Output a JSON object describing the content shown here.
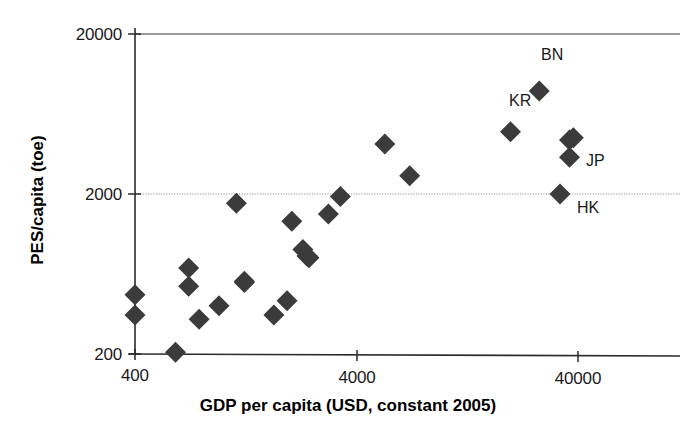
{
  "chart_data": {
    "type": "scatter",
    "title": "",
    "xlabel": "GDP per capita (USD, constant 2005)",
    "ylabel": "PES/capita (toe)",
    "xscale": "log",
    "yscale": "log",
    "xlim": [
      400,
      63000
    ],
    "ylim": [
      200,
      20000
    ],
    "xticks": [
      400,
      4000,
      40000
    ],
    "xticklabels": [
      "400",
      "4000",
      "40000"
    ],
    "yticks": [
      200,
      2000,
      20000
    ],
    "yticklabels": [
      "200",
      "2000",
      "20000"
    ],
    "grid": "horizontal-only",
    "legend": "none",
    "marker": "diamond",
    "marker_color": "#3b3b3b",
    "series": [
      {
        "name": "Asian economies",
        "points": [
          {
            "label": "",
            "x": 400,
            "y": 470
          },
          {
            "label": "",
            "x": 400,
            "y": 350
          },
          {
            "label": "",
            "x": 610,
            "y": 205
          },
          {
            "label": "",
            "x": 700,
            "y": 690
          },
          {
            "label": "",
            "x": 700,
            "y": 530
          },
          {
            "label": "",
            "x": 780,
            "y": 330
          },
          {
            "label": "",
            "x": 960,
            "y": 400
          },
          {
            "label": "",
            "x": 1150,
            "y": 1750
          },
          {
            "label": "",
            "x": 1250,
            "y": 570
          },
          {
            "label": "",
            "x": 1250,
            "y": 560
          },
          {
            "label": "",
            "x": 1700,
            "y": 350
          },
          {
            "label": "",
            "x": 1950,
            "y": 430
          },
          {
            "label": "",
            "x": 2050,
            "y": 1350
          },
          {
            "label": "",
            "x": 2300,
            "y": 900
          },
          {
            "label": "",
            "x": 2450,
            "y": 800
          },
          {
            "label": "",
            "x": 2400,
            "y": 820
          },
          {
            "label": "",
            "x": 3000,
            "y": 1500
          },
          {
            "label": "",
            "x": 3400,
            "y": 1930
          },
          {
            "label": "",
            "x": 5400,
            "y": 4100
          },
          {
            "label": "",
            "x": 7000,
            "y": 2600
          },
          {
            "label": "KR",
            "x": 20000,
            "y": 4900
          },
          {
            "label": "BN",
            "x": 27000,
            "y": 8800
          },
          {
            "label": "JP",
            "x": 37000,
            "y": 4350
          },
          {
            "label": "",
            "x": 38500,
            "y": 4500
          },
          {
            "label": "",
            "x": 37000,
            "y": 3400
          },
          {
            "label": "HK",
            "x": 33500,
            "y": 2000
          }
        ]
      }
    ],
    "annotations": [
      {
        "text": "BN",
        "for": "BN"
      },
      {
        "text": "KR",
        "for": "KR"
      },
      {
        "text": "JP",
        "for": "JP"
      },
      {
        "text": "HK",
        "for": "HK"
      }
    ]
  },
  "axes": {
    "y_tick_labels": [
      "20000",
      "2000",
      "200"
    ],
    "x_tick_labels": [
      "400",
      "4000",
      "40000"
    ],
    "y_title": "PES/capita (toe)",
    "x_title": "GDP per capita (USD, constant 2005)"
  },
  "labels": {
    "bn": "BN",
    "kr": "KR",
    "jp": "JP",
    "hk": "HK"
  },
  "colors": {
    "marker": "#3b3b3b",
    "axis": "#333333",
    "grid": "#999999",
    "text": "#1a1a1a"
  }
}
